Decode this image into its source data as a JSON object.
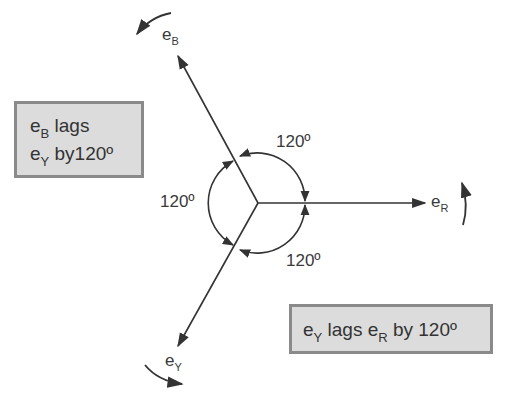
{
  "diagram": {
    "type": "three-phase phasor diagram",
    "phasors": [
      {
        "name": "e",
        "sub": "R",
        "angle_deg": 0
      },
      {
        "name": "e",
        "sub": "B",
        "angle_deg": 120
      },
      {
        "name": "e",
        "sub": "Y",
        "angle_deg": 240
      }
    ],
    "angle_labels": [
      "120º",
      "120º",
      "120º"
    ],
    "rotation": "counter-clockwise"
  },
  "labels": {
    "eB": {
      "base": "e",
      "sub": "B"
    },
    "eR": {
      "base": "e",
      "sub": "R"
    },
    "eY": {
      "base": "e",
      "sub": "Y"
    },
    "angle_top": "120º",
    "angle_left": "120º",
    "angle_bottom": "120º"
  },
  "notes": {
    "box1": {
      "l1_base": "e",
      "l1_sub": "B",
      "l1_rest": " lags",
      "l2_base": "e",
      "l2_sub": "Y",
      "l2_rest": " by120º"
    },
    "box2": {
      "base1": "e",
      "sub1": "Y",
      "mid": " lags ",
      "base2": "e",
      "sub2": "R",
      "rest": " by 120º"
    }
  },
  "colors": {
    "line": "#333333",
    "box_fill": "#dcdcdc",
    "box_border": "#8a8a8a"
  }
}
